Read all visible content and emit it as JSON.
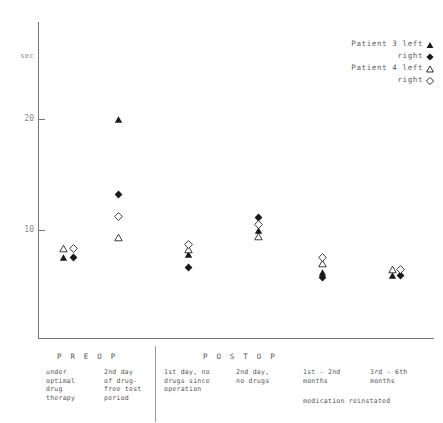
{
  "chart_data": {
    "type": "scatter",
    "title": "",
    "xlabel": "",
    "ylabel": "sec",
    "ylim": [
      0,
      28
    ],
    "yticks": [
      10,
      20
    ],
    "ytick_labels": [
      "10",
      "20"
    ],
    "grid": false,
    "legend_position": "top-right",
    "categories": [
      "under optimal drug therapy",
      "2nd day of drug-free test period",
      "1st day, no drugs since operation",
      "2nd day, no drugs",
      "1st - 2nd months",
      "3rd - 6th months"
    ],
    "series": [
      {
        "name": "Patient 3 left",
        "marker": "filled-triangle",
        "color": "#1a1a1a",
        "values": [
          7.5,
          20.0,
          7.8,
          10.0,
          6.2,
          5.9
        ]
      },
      {
        "name": "Patient 3 right",
        "marker": "filled-diamond",
        "color": "#1a1a1a",
        "values": [
          7.5,
          13.2,
          6.6,
          11.1,
          5.7,
          5.9
        ]
      },
      {
        "name": "Patient 4 left",
        "marker": "open-triangle",
        "color": "#1a1a1a",
        "values": [
          8.3,
          9.3,
          8.2,
          9.4,
          7.0,
          6.4
        ]
      },
      {
        "name": "Patient 4 right",
        "marker": "open-diamond",
        "color": "#1a1a1a",
        "values": [
          8.3,
          11.2,
          8.7,
          10.5,
          7.5,
          6.4
        ]
      }
    ],
    "annotations": [
      "medication reinstated"
    ]
  },
  "axis": {
    "y_unit_label": "sec",
    "ticks": [
      {
        "label": "20",
        "value": 20
      },
      {
        "label": "10",
        "value": 10
      }
    ]
  },
  "legend": {
    "rows": [
      {
        "patient": "Patient  3",
        "side": "left",
        "marker": "filled-triangle"
      },
      {
        "patient": "",
        "side": "right",
        "marker": "filled-diamond"
      },
      {
        "patient": "Patient  4",
        "side": "left",
        "marker": "open-triangle"
      },
      {
        "patient": "",
        "side": "right",
        "marker": "open-diamond"
      }
    ]
  },
  "footer": {
    "phases": [
      {
        "label": "P R E O P"
      },
      {
        "label": "P O S T O P"
      }
    ],
    "columns": [
      {
        "caption": "under\noptimal\ndrug\ntherapy"
      },
      {
        "caption": "2nd day\nof drug-\nfree test\nperiod"
      },
      {
        "caption": "1st day, no\ndrugs since\noperation"
      },
      {
        "caption": "2nd day,\nno drugs"
      },
      {
        "caption": "1st - 2nd\nmonths"
      },
      {
        "caption": "3rd - 6th\nmonths"
      }
    ],
    "note": "medication reinstated"
  }
}
